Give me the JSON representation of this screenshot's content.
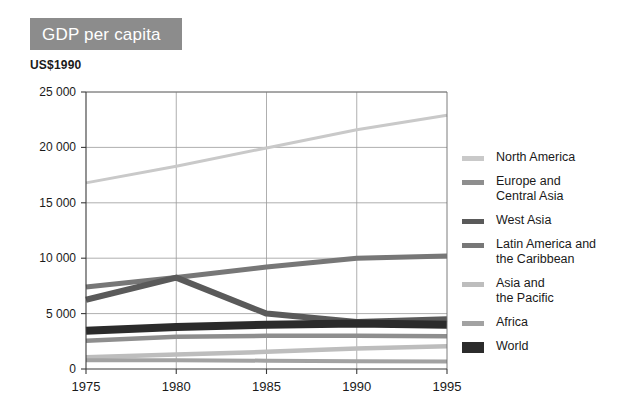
{
  "title": "GDP per capita",
  "unit_label": "US$1990",
  "colors": {
    "banner_bg": "#8c8c8c",
    "banner_text": "#ffffff",
    "north_america": "#c9c9c9",
    "europe_central_asia": "#8e8e8e",
    "west_asia": "#5a5a5a",
    "latin_america": "#777777",
    "asia_pacific": "#bdbdbd",
    "africa": "#a2a2a2",
    "world": "#2b2b2b",
    "grid": "#9a9a9a",
    "axis": "#3a3a3a"
  },
  "legend": {
    "items": [
      {
        "label": "North America",
        "color": "#c9c9c9",
        "weight": "thin"
      },
      {
        "label": "Europe and\nCentral Asia",
        "color": "#8e8e8e",
        "weight": "thin"
      },
      {
        "label": "West Asia",
        "color": "#5a5a5a",
        "weight": "thin"
      },
      {
        "label": "Latin America and\nthe Caribbean",
        "color": "#777777",
        "weight": "thin"
      },
      {
        "label": "Asia and\nthe Pacific",
        "color": "#bdbdbd",
        "weight": "thin"
      },
      {
        "label": "Africa",
        "color": "#a2a2a2",
        "weight": "thin"
      },
      {
        "label": "World",
        "color": "#2b2b2b",
        "weight": "thick"
      }
    ]
  },
  "chart_data": {
    "type": "line",
    "title": "GDP per capita",
    "subtitle": "US$1990",
    "xlabel": "",
    "ylabel": "US$1990",
    "categories": [
      1975,
      1980,
      1985,
      1990,
      1995
    ],
    "x": [
      1975,
      1980,
      1985,
      1990,
      1995
    ],
    "xtick_labels": [
      "1975",
      "1980",
      "1985",
      "1990",
      "1995"
    ],
    "ytick_labels": [
      "0",
      "5 000",
      "10 000",
      "15 000",
      "20 000",
      "25 000"
    ],
    "yticks": [
      0,
      5000,
      10000,
      15000,
      20000,
      25000
    ],
    "ylim": [
      0,
      25000
    ],
    "xlim": [
      1975,
      1995
    ],
    "grid": true,
    "legend_position": "right",
    "series": [
      {
        "name": "North America",
        "color": "#c9c9c9",
        "width": 3.0,
        "values": [
          16800,
          18300,
          19950,
          21600,
          22900
        ]
      },
      {
        "name": "Europe and Central Asia",
        "color": "#8e8e8e",
        "width": 4.5,
        "values": [
          2550,
          2900,
          3000,
          3000,
          2950
        ]
      },
      {
        "name": "West Asia",
        "color": "#5a5a5a",
        "width": 6.0,
        "values": [
          6250,
          8250,
          5000,
          4250,
          4500
        ]
      },
      {
        "name": "Latin America and the Caribbean",
        "color": "#777777",
        "width": 5.0,
        "values": [
          7400,
          8250,
          9200,
          10000,
          10200
        ]
      },
      {
        "name": "Asia and the Pacific",
        "color": "#bdbdbd",
        "width": 4.5,
        "values": [
          1050,
          1300,
          1550,
          1850,
          2050
        ]
      },
      {
        "name": "Africa",
        "color": "#a2a2a2",
        "width": 4.0,
        "values": [
          800,
          800,
          750,
          700,
          680
        ]
      },
      {
        "name": "World",
        "color": "#2b2b2b",
        "width": 8.0,
        "values": [
          3450,
          3800,
          4000,
          4100,
          4000
        ]
      }
    ]
  },
  "geometry": {
    "plot_left": 86,
    "plot_right": 447,
    "plot_top": 92,
    "plot_bottom": 369
  }
}
